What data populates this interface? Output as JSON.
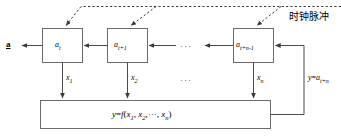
{
  "diagram": {
    "clock_label": "时钟脉冲",
    "output_label": "a",
    "registers": [
      {
        "name": "register-at",
        "base": "a",
        "sub": "t"
      },
      {
        "name": "register-at1",
        "base": "a",
        "sub": "t+1"
      },
      {
        "name": "register-atn1",
        "base": "a",
        "sub": "t+n-1"
      }
    ],
    "register_ellipsis": "···",
    "taps": [
      {
        "base": "x",
        "sub": "1"
      },
      {
        "base": "x",
        "sub": "2"
      },
      {
        "base": "x",
        "sub": "n"
      }
    ],
    "tap_ellipsis": "···",
    "function_box": {
      "lhs": "y",
      "eq": "=",
      "fname": "f",
      "open": "(",
      "arg1_base": "x",
      "arg1_sub": "1",
      "sep1": ",",
      "arg2_base": "x",
      "arg2_sub": "2",
      "sep2": ",",
      "inner_ellipsis": "···",
      "sep3": ",",
      "argn_base": "x",
      "argn_sub": "n",
      "close": ")"
    },
    "feedback": {
      "lhs": "y",
      "eq": "=",
      "rhs_base": "a",
      "rhs_sub": "t+n"
    },
    "colors": {
      "line": "#4a4a4a",
      "dashed": "#3a3a3a",
      "box_border": "#6b6b6b",
      "text": "#000000",
      "background": "#ffffff"
    }
  }
}
